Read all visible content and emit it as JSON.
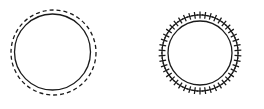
{
  "canvas": {
    "width": 264,
    "height": 109,
    "background": "#ffffff",
    "stroke_color": "#1a1a1a"
  },
  "figures": [
    {
      "id": "dashed-ring-figure",
      "label": "Circle with dashed outer circle",
      "panel": "left",
      "solid_circle": {
        "cx": 52.5,
        "cy": 52.0,
        "r": 38.0,
        "stroke": "#1a1a1a",
        "stroke_width": 1.3,
        "style": "solid"
      },
      "dashed_circle": {
        "cx": 53.5,
        "cy": 52.5,
        "r": 42.5,
        "stroke": "#1a1a1a",
        "stroke_width": 1.3,
        "style": "dashed",
        "dash_pattern": "4,3"
      }
    },
    {
      "id": "cross-ring-figure",
      "label": "Circle with radial plus markers",
      "panel": "right",
      "solid_circle": {
        "cx": 200.0,
        "cy": 53.0,
        "r": 32.0,
        "stroke": "#1a1a1a",
        "stroke_width": 1.3,
        "style": "solid"
      },
      "markers": {
        "glyph": "plus-cross",
        "count": 46,
        "radius": 38.0,
        "arm_length": 3.4,
        "stroke": "#1a1a1a",
        "stroke_width": 1.25,
        "orientation": "radial",
        "start_angle_deg": -90
      }
    }
  ],
  "chart_data": {
    "type": "scatter",
    "title": "",
    "xlabel": "",
    "ylabel": "",
    "grid": false,
    "legend": null,
    "xlim": [
      0,
      264
    ],
    "ylim": [
      0,
      109
    ],
    "series": [
      {
        "name": "left-solid-circle",
        "render": "circle-outline",
        "center": [
          52.5,
          52.0
        ],
        "radius": 38.0,
        "linestyle": "solid",
        "values": []
      },
      {
        "name": "left-dashed-circle",
        "render": "circle-outline",
        "center": [
          53.5,
          52.5
        ],
        "radius": 42.5,
        "linestyle": "dashed",
        "values": []
      },
      {
        "name": "right-solid-circle",
        "render": "circle-outline",
        "center": [
          200.0,
          53.0
        ],
        "radius": 32.0,
        "linestyle": "solid",
        "values": []
      },
      {
        "name": "right-plus-markers",
        "render": "marker-ring",
        "center": [
          200.0,
          53.0
        ],
        "radius": 38.0,
        "marker": "plus",
        "n_points": 46,
        "values": []
      }
    ]
  }
}
